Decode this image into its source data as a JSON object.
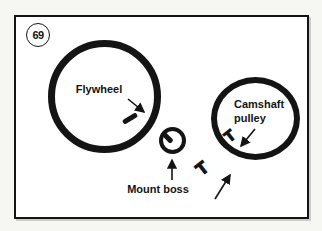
{
  "figure_badge": {
    "number": "69"
  },
  "parts": {
    "flywheel": {
      "label": "Flywheel"
    },
    "camshaft_pulley": {
      "label_line1": "Camshaft",
      "label_line2": "pulley"
    },
    "mount_boss": {
      "label": "Mount boss"
    }
  },
  "timing_marks": {
    "camshaft_mark": "T",
    "belt_mark": "T"
  },
  "colors": {
    "ink": "#141414",
    "paper": "#ffffff",
    "page_background": "#f6f6f3"
  }
}
